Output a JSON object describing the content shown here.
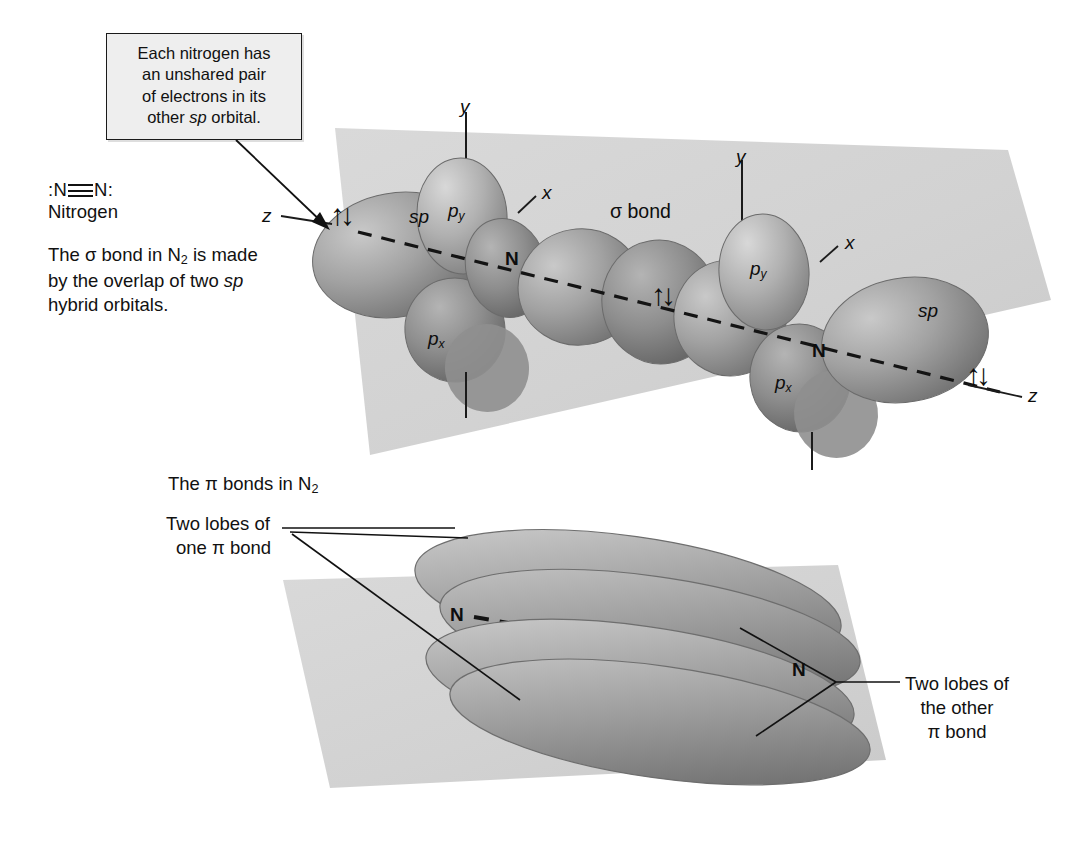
{
  "figure": {
    "callout": {
      "line1": "Each nitrogen has",
      "line2": "an unshared pair",
      "line3": "of electrons in its",
      "line4_pre": "other ",
      "line4_italic": "sp",
      "line4_post": " orbital."
    },
    "legend": {
      "formula_n_left": ":N",
      "formula_n_right": "N:",
      "formula_bond": "triple-bond",
      "nitrogen_label": "Nitrogen",
      "sigma_paragraph_pre": "The σ bond in N",
      "sigma_paragraph_sub": "2",
      "sigma_paragraph_mid": " is made by the overlap of two ",
      "sigma_paragraph_italic": "sp",
      "sigma_paragraph_post": " hybrid orbitals."
    },
    "upper_diagram": {
      "name": "sigma-bond-sp-hybrid-diagram",
      "plane_color": "#d4d4d4",
      "lobe_color": "#9a9a9a",
      "bond_axis_style": "dashed",
      "labels": {
        "z_left": "z",
        "sp_left": "sp",
        "py_left_base": "p",
        "py_left_sub": "y",
        "px_left_base": "p",
        "px_left_sub": "x",
        "y_left": "y",
        "x_left": "x",
        "n_left": "N",
        "sigma_bond": "σ bond",
        "n_right": "N",
        "y_right": "y",
        "x_right": "x",
        "py_right_base": "p",
        "py_right_sub": "y",
        "px_right_base": "p",
        "px_right_sub": "x",
        "sp_right": "sp",
        "z_right": "z",
        "electron_pair_left": "↑↓",
        "electron_pair_center": "↑↓",
        "electron_pair_right": "↑↓"
      }
    },
    "lower_diagram": {
      "name": "pi-bond-diagram",
      "plane_color": "#d4d4d4",
      "lobe_color": "#9a9a9a",
      "heading_pre": "The π bonds in N",
      "heading_sub": "2",
      "left_label_line1": "Two lobes of",
      "left_label_line2": "one π bond",
      "right_label_line1": "Two lobes of",
      "right_label_line2": "the other",
      "right_label_line3": "π bond",
      "n_left": "N",
      "n_right": "N"
    }
  }
}
